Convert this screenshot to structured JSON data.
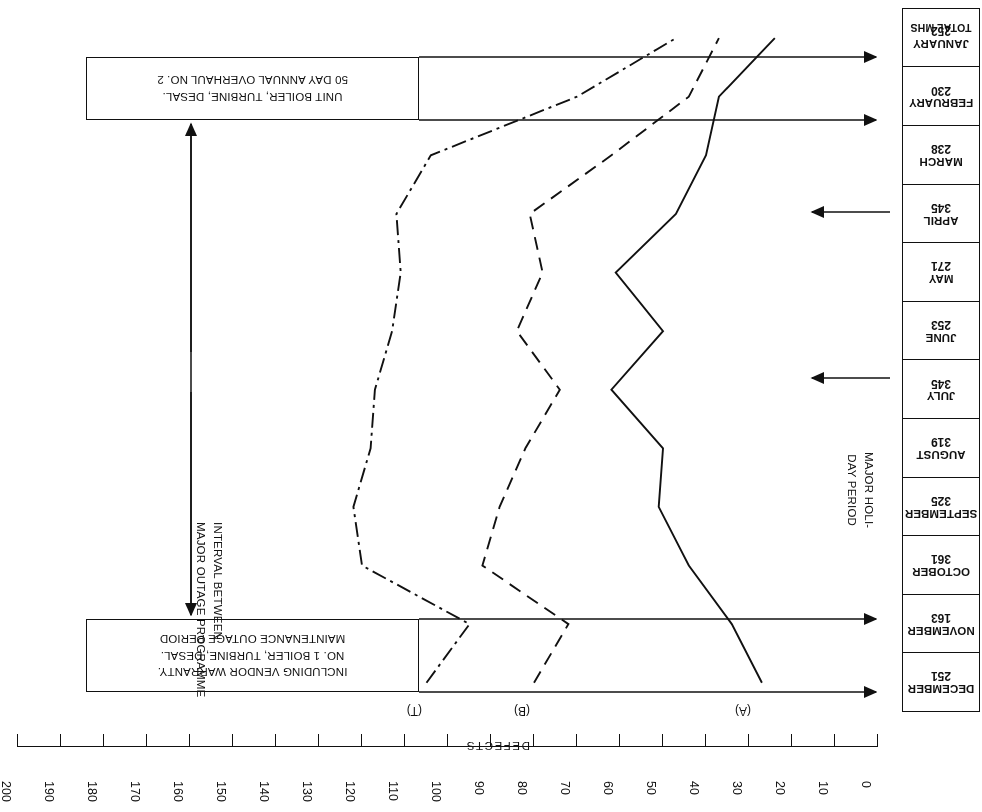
{
  "chart_data": {
    "type": "line",
    "title": "",
    "xlabel": "DEFECTS",
    "ylabel": "",
    "orientation": "horizontal-rotated-180",
    "xlim": [
      0,
      200
    ],
    "grid": false,
    "legend_position": "inline-at-series-start",
    "axis_ticks": [
      0,
      10,
      20,
      30,
      40,
      50,
      60,
      70,
      80,
      90,
      100,
      110,
      120,
      130,
      140,
      150,
      160,
      170,
      180,
      190,
      200
    ],
    "categories": [
      "JANUARY",
      "FEBRUARY",
      "MARCH",
      "APRIL",
      "MAY",
      "JUNE",
      "JULY",
      "AUGUST",
      "SEPTEMBER",
      "OCTOBER",
      "NOVEMBER",
      "DECEMBER"
    ],
    "total_mhs_header": "TOTAL MHS",
    "total_mhs": [
      252,
      230,
      238,
      345,
      271,
      253,
      345,
      319,
      325,
      361,
      163,
      251
    ],
    "series": [
      {
        "name": "(T)",
        "style": "dash-dot",
        "values": [
          105,
          95,
          120,
          122,
          118,
          117,
          113,
          111,
          112,
          104,
          70,
          47
        ]
      },
      {
        "name": "(B)",
        "style": "dashed",
        "values": [
          80,
          72,
          92,
          88,
          82,
          74,
          84,
          78,
          81,
          62,
          44,
          37
        ]
      },
      {
        "name": "(A)",
        "style": "solid",
        "values": [
          27,
          34,
          44,
          51,
          50,
          62,
          50,
          61,
          47,
          40,
          37,
          24
        ]
      }
    ],
    "annotations": [
      {
        "id": "annual-overhaul",
        "lines": [
          "50 DAY ANNUAL OVERHAUL NO. 2",
          "UNIT BOILER, TURBINE, DESAL."
        ]
      },
      {
        "id": "maintenance-outage",
        "lines": [
          "MAINTENANCE OUTAGE PERIOD",
          "NO. 1 BOILER, TURBINE, DESAL.",
          "INCLUDING VENDOR WARRANTY."
        ]
      },
      {
        "id": "interval",
        "lines": [
          "INTERVAL BETWEEN",
          "MAJOR OUTAGE PROGRAMME"
        ]
      },
      {
        "id": "holiday",
        "lines": [
          "MAJOR HOLI-",
          "DAY PERIOD"
        ]
      }
    ]
  },
  "axis": {
    "name": "DEFECTS",
    "ticks": [
      "200",
      "190",
      "180",
      "170",
      "160",
      "150",
      "140",
      "130",
      "120",
      "110",
      "100",
      "90",
      "80",
      "70",
      "60",
      "50",
      "40",
      "30",
      "20",
      "10",
      "0"
    ]
  },
  "months_table": {
    "header": "TOTAL MHS",
    "rows": [
      {
        "name": "DECEMBER",
        "value": "251"
      },
      {
        "name": "NOVEMBER",
        "value": "163"
      },
      {
        "name": "OCTOBER",
        "value": "361"
      },
      {
        "name": "SEPTEMBER",
        "value": "325"
      },
      {
        "name": "AUGUST",
        "value": "319"
      },
      {
        "name": "JULY",
        "value": "345"
      },
      {
        "name": "JUNE",
        "value": "253"
      },
      {
        "name": "MAY",
        "value": "271"
      },
      {
        "name": "APRIL",
        "value": "345"
      },
      {
        "name": "MARCH",
        "value": "238"
      },
      {
        "name": "FEBRUARY",
        "value": "230"
      },
      {
        "name": "JANUARY",
        "value": "252"
      }
    ]
  },
  "annotations": {
    "overhaul_l1": "50 DAY ANNUAL OVERHAUL NO. 2",
    "overhaul_l2": "UNIT BOILER, TURBINE, DESAL.",
    "outage_l1": "MAINTENANCE OUTAGE PERIOD",
    "outage_l2": "NO. 1 BOILER, TURBINE, DESAL.",
    "outage_l3": "INCLUDING VENDOR WARRANTY.",
    "interval_l1": "INTERVAL BETWEEN",
    "interval_l2": "MAJOR OUTAGE PROGRAMME",
    "holiday_l1": "MAJOR HOLI-",
    "holiday_l2": "DAY PERIOD"
  },
  "series_labels": {
    "t": "(T)",
    "b": "(B)",
    "a": "(A)"
  }
}
